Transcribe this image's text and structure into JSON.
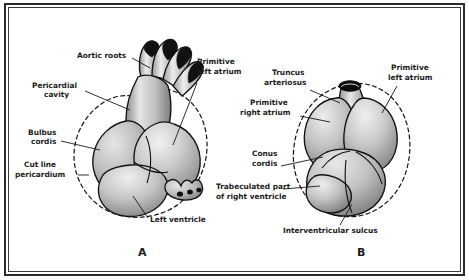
{
  "figure": {
    "frame_color": "#2b2b2b",
    "background": "#ffffff",
    "ink_color": "#1a1a1a"
  },
  "panels": [
    {
      "id": "A",
      "letter": "A",
      "labels": [
        {
          "id": "aortic-roots",
          "text": "Aortic roots",
          "lines": [
            "Aortic roots"
          ]
        },
        {
          "id": "pericardial-cavity",
          "text": "Pericardial cavity",
          "lines": [
            "Pericardial",
            "cavity"
          ]
        },
        {
          "id": "bulbus-cordis",
          "text": "Bulbus cordis",
          "lines": [
            "Bulbus",
            "cordis"
          ]
        },
        {
          "id": "cut-line-pericardium",
          "text": "Cut line pericardium",
          "lines": [
            "Cut line",
            "pericardium"
          ]
        },
        {
          "id": "primitive-left-atrium",
          "text": "Primitive left atrium",
          "lines": [
            "Primitive",
            "left atrium"
          ]
        },
        {
          "id": "left-ventricle",
          "text": "Left ventricle",
          "lines": [
            "Left ventricle"
          ]
        }
      ]
    },
    {
      "id": "B",
      "letter": "B",
      "labels": [
        {
          "id": "truncus-arteriosus",
          "text": "Truncus arteriosus",
          "lines": [
            "Truncus",
            "arteriosus"
          ]
        },
        {
          "id": "primitive-left-atrium-b",
          "text": "Primitive left atrium",
          "lines": [
            "Primitive",
            "left atrium"
          ]
        },
        {
          "id": "primitive-right-atrium",
          "text": "Primitive right atrium",
          "lines": [
            "Primitive",
            "right atrium"
          ]
        },
        {
          "id": "conus-cordis",
          "text": "Conus cordis",
          "lines": [
            "Conus",
            "cordis"
          ]
        },
        {
          "id": "trabeculated-part-right-ventricle",
          "text": "Trabeculated part of right ventricle",
          "lines": [
            "Trabeculated part",
            "of right ventricle"
          ]
        },
        {
          "id": "interventricular-sulcus",
          "text": "Interventricular sulcus",
          "lines": [
            "Interventricular sulcus"
          ]
        }
      ]
    }
  ],
  "text": {
    "a_aortic_roots": "Aortic roots",
    "a_pericardial_1": "Pericardial",
    "a_pericardial_2": "cavity",
    "a_bulbus_1": "Bulbus",
    "a_bulbus_2": "cordis",
    "a_cutline_1": "Cut line",
    "a_cutline_2": "pericardium",
    "a_prim_left_atrium_1": "Primitive",
    "a_prim_left_atrium_2": "left atrium",
    "a_left_ventricle": "Left ventricle",
    "a_letter": "A",
    "b_truncus_1": "Truncus",
    "b_truncus_2": "arteriosus",
    "b_prim_left_atrium_1": "Primitive",
    "b_prim_left_atrium_2": "left atrium",
    "b_prim_right_atrium_1": "Primitive",
    "b_prim_right_atrium_2": "right atrium",
    "b_conus_1": "Conus",
    "b_conus_2": "cordis",
    "b_trabeculated_1": "Trabeculated part",
    "b_trabeculated_2": "of right ventricle",
    "b_interventricular": "Interventricular sulcus",
    "b_letter": "B"
  }
}
